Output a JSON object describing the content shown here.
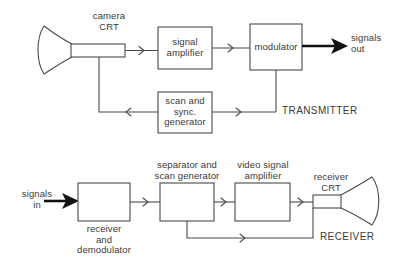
{
  "diagram": {
    "stroke_color": "#4a4a4a",
    "bold_color": "#111111",
    "background": "#ffffff"
  },
  "transmitter": {
    "section_label": "TRANSMITTER",
    "camera_crt_label": "camera\nCRT",
    "blocks": [
      {
        "id": "signal-amplifier",
        "label": "signal\namplifier"
      },
      {
        "id": "modulator",
        "label": "modulator"
      },
      {
        "id": "scan-sync-generator",
        "label": "scan and\nsync.\ngenerator"
      }
    ],
    "output_label": "signals\nout"
  },
  "receiver": {
    "section_label": "RECEIVER",
    "receiver_crt_label": "receiver\nCRT",
    "input_label": "signals\nin",
    "blocks": [
      {
        "id": "receiver-demodulator",
        "label": "receiver\nand\ndemodulator"
      },
      {
        "id": "separator-scan-generator",
        "label": "separator and\nscan generator"
      },
      {
        "id": "video-signal-amplifier",
        "label": "video signal\namplifier"
      }
    ]
  }
}
